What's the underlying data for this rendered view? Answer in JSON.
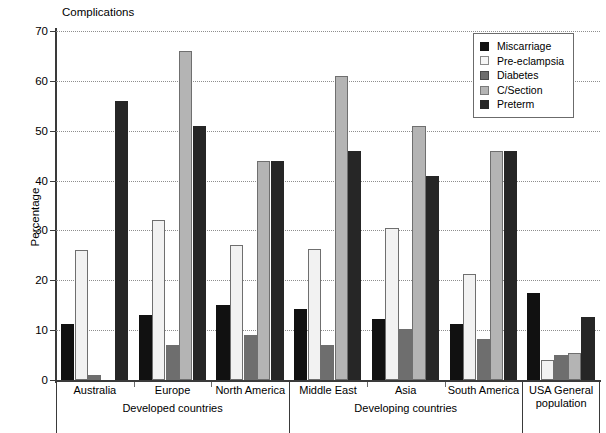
{
  "chart_data": {
    "type": "bar",
    "title": "Complications",
    "xlabel": "",
    "ylabel": "Percentage",
    "ylim": [
      0,
      70
    ],
    "ytick_step": 10,
    "yticks": [
      0,
      10,
      20,
      30,
      40,
      50,
      60,
      70
    ],
    "grid": "horizontal-dotted",
    "legend_position": "top-right",
    "categories": [
      "Australia",
      "Europe",
      "North America",
      "Middle East",
      "Asia",
      "South America",
      "USA General population"
    ],
    "groups": [
      {
        "label": "Developed countries",
        "categories": [
          "Australia",
          "Europe",
          "North America"
        ]
      },
      {
        "label": "Developing countries",
        "categories": [
          "Middle East",
          "Asia",
          "South America"
        ]
      },
      {
        "label": "USA General population",
        "categories": [
          "USA General population"
        ]
      }
    ],
    "series": [
      {
        "name": "Miscarriage",
        "color": "#111111",
        "values": [
          11.2,
          13.1,
          15.1,
          14.2,
          12.2,
          11.3,
          17.5
        ]
      },
      {
        "name": "Pre-eclampsia",
        "color": "#f2f2f2",
        "values": [
          26.1,
          32.1,
          27.1,
          26.2,
          30.4,
          21.3,
          4.0
        ]
      },
      {
        "name": "Diabetes",
        "color": "#6e6e6e",
        "values": [
          1.0,
          7.0,
          9.1,
          7.0,
          10.2,
          8.3,
          5.0
        ]
      },
      {
        "name": "C/Section",
        "color": "#b4b4b4",
        "values": [
          0.0,
          66.0,
          44.0,
          61.0,
          51.0,
          46.0,
          5.5
        ]
      },
      {
        "name": "Preterm",
        "color": "#262626",
        "values": [
          56.0,
          51.0,
          44.0,
          46.0,
          41.0,
          46.0,
          12.7
        ]
      }
    ]
  },
  "legend": {
    "items": [
      {
        "label": "Miscarriage",
        "swatch_color": "#111111",
        "swatch_border": "#111111"
      },
      {
        "label": "Pre-eclampsia",
        "swatch_color": "#f6f6f6",
        "swatch_border": "#8a8a8a"
      },
      {
        "label": "Diabetes",
        "swatch_color": "#6e6e6e",
        "swatch_border": "#4a4a4a"
      },
      {
        "label": "C/Section",
        "swatch_color": "#b4b4b4",
        "swatch_border": "#7a7a7a"
      },
      {
        "label": "Preterm",
        "swatch_color": "#262626",
        "swatch_border": "#262626"
      }
    ]
  },
  "axes": {
    "y_title": "Percentage",
    "y_tick_labels": [
      "0",
      "10",
      "20",
      "30",
      "40",
      "50",
      "60",
      "70"
    ]
  }
}
